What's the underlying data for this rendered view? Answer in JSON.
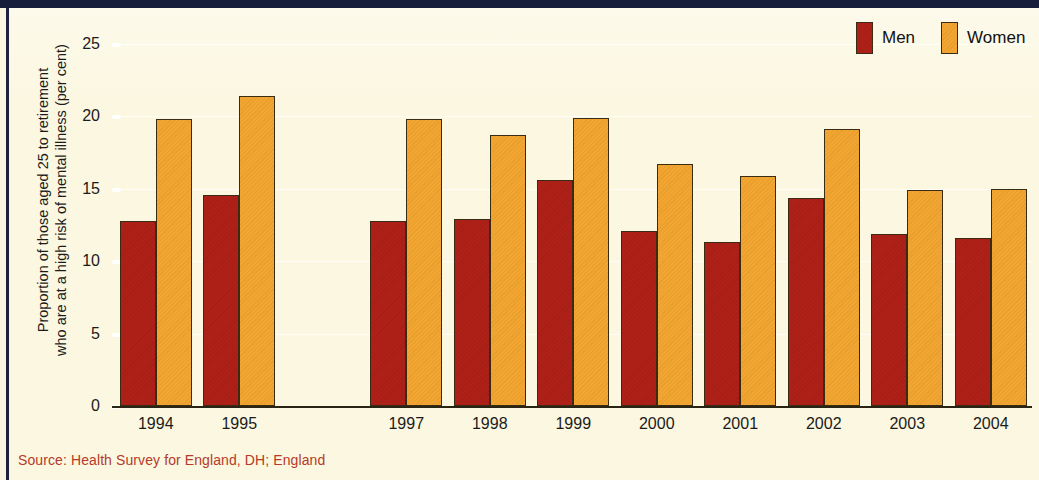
{
  "figure": {
    "source_note": "Source: Health Survey for England, DH; England",
    "accent_navy": "#161E3C",
    "background": "#FBF7E0",
    "source_color": "#B63A28"
  },
  "legend": {
    "position": "top-right",
    "entries": [
      {
        "label": "Men",
        "color": "#AF2118"
      },
      {
        "label": "Women",
        "color": "#F2A631"
      }
    ]
  },
  "chart_data": {
    "type": "bar",
    "title": "",
    "subtitle": "",
    "xlabel": "",
    "ylabel": "Proportion of those aged 25 to retirement who are at a high risk of mental illness (per cent)",
    "ylabel_line1": "Proportion of those aged 25 to retirement",
    "ylabel_line2": "who are at a high risk of mental illness (per cent)",
    "categories": [
      "1994",
      "1995",
      "1997",
      "1998",
      "1999",
      "2000",
      "2001",
      "2002",
      "2003",
      "2004"
    ],
    "missing_categories": [
      "1996"
    ],
    "series": [
      {
        "name": "Men",
        "color": "#AF2118",
        "values": [
          12.8,
          14.6,
          12.8,
          12.9,
          15.6,
          12.1,
          11.3,
          14.4,
          11.9,
          11.6
        ]
      },
      {
        "name": "Women",
        "color": "#F2A631",
        "values": [
          19.8,
          21.4,
          19.8,
          18.7,
          19.9,
          16.7,
          15.9,
          19.1,
          14.9,
          15.0
        ]
      }
    ],
    "ylim": [
      0,
      25
    ],
    "yticks": [
      0,
      5,
      10,
      15,
      20,
      25
    ],
    "ytick_labels": [
      "0",
      "5",
      "10",
      "15",
      "20",
      "25"
    ],
    "grid": true,
    "legend_position": "top-right"
  }
}
